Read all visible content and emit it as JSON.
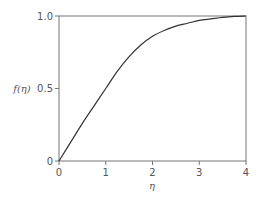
{
  "chart_data": {
    "type": "line",
    "title": "",
    "xlabel": "η",
    "ylabel": "f(η)",
    "xlim": [
      0,
      4
    ],
    "ylim": [
      0,
      1.0
    ],
    "grid": false,
    "legend": null,
    "x_ticks": [
      0,
      1,
      2,
      3,
      4
    ],
    "x_tick_labels": [
      "0",
      "1",
      "2",
      "3",
      "4"
    ],
    "y_ticks": [
      0,
      0.5,
      1.0
    ],
    "y_tick_labels": [
      "0",
      "0.5",
      "1.0"
    ],
    "series": [
      {
        "name": "f(η)",
        "x": [
          0,
          0.25,
          0.5,
          0.75,
          1.0,
          1.25,
          1.5,
          1.75,
          2.0,
          2.25,
          2.5,
          2.75,
          3.0,
          3.25,
          3.5,
          3.75,
          4.0
        ],
        "values": [
          0,
          0.13,
          0.26,
          0.38,
          0.5,
          0.62,
          0.72,
          0.8,
          0.86,
          0.9,
          0.93,
          0.95,
          0.97,
          0.98,
          0.99,
          0.997,
          1.0
        ]
      }
    ]
  }
}
